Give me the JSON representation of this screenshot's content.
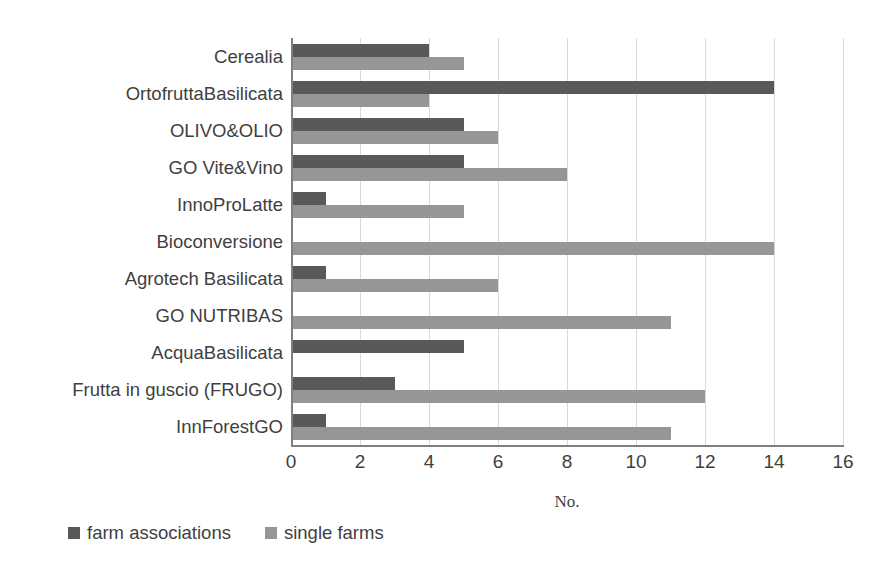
{
  "chart_data": {
    "type": "bar",
    "orientation": "horizontal",
    "title": "",
    "xlabel": "No.",
    "ylabel": "",
    "xlim": [
      0,
      16
    ],
    "xticks": [
      0,
      2,
      4,
      6,
      8,
      10,
      12,
      14,
      16
    ],
    "grid": "vertical",
    "legend_position": "bottom-left",
    "categories": [
      "Cerealia",
      "OrtofruttaBasilicata",
      "OLIVO&OLIO",
      "GO Vite&Vino",
      "InnoProLatte",
      "Bioconversione",
      "Agrotech Basilicata",
      "GO NUTRIBAS",
      "AcquaBasilicata",
      "Frutta in guscio (FRUGO)",
      "InnForestGO"
    ],
    "series": [
      {
        "name": "farm associations",
        "color": "#595959",
        "values": [
          4,
          14,
          5,
          5,
          1,
          0,
          1,
          0,
          5,
          3,
          1
        ]
      },
      {
        "name": "single farms",
        "color": "#969696",
        "values": [
          5,
          4,
          6,
          8,
          5,
          14,
          6,
          11,
          0,
          12,
          11
        ]
      }
    ]
  },
  "axis": {
    "x_title": "No.",
    "tick_labels": [
      "0",
      "2",
      "4",
      "6",
      "8",
      "10",
      "12",
      "14",
      "16"
    ]
  },
  "legend": {
    "items": [
      {
        "label": "farm associations",
        "color": "#595959"
      },
      {
        "label": "single farms",
        "color": "#969696"
      }
    ]
  },
  "colors": {
    "gridline": "#d9d9d9",
    "axis": "#7f7f7f",
    "text": "#3f3f3f",
    "background": "#ffffff"
  }
}
